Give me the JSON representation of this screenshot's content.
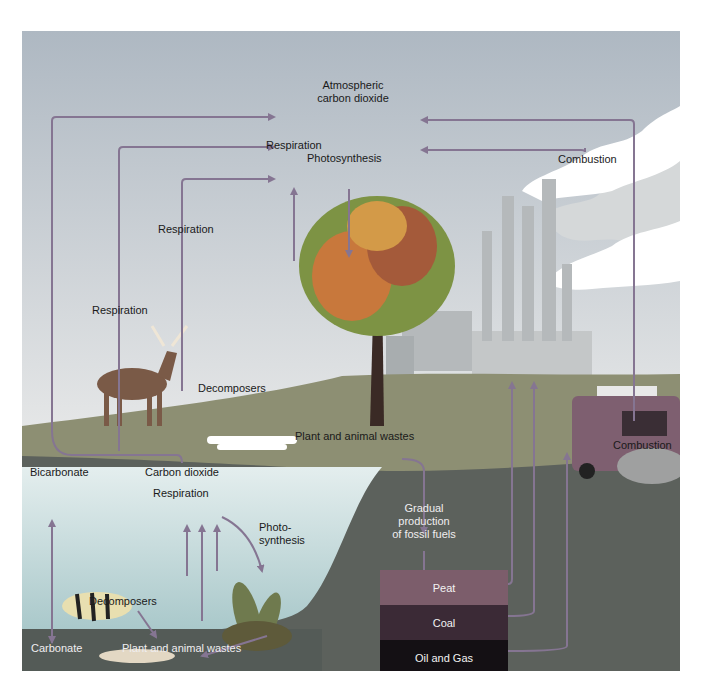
{
  "diagram": {
    "colors": {
      "sky_top": "#aeb8c2",
      "sky_bottom": "#e6e8e9",
      "land": "#8c8e74",
      "lake": "#cfe2e3",
      "lake_floor": "#515a55",
      "underground": "#565b57",
      "arrow": "#857592",
      "peat": "#7c5d6b",
      "coal": "#3b2a36",
      "oil_gas": "#141014"
    },
    "labels": {
      "atmospheric_co2_line1": "Atmospheric",
      "atmospheric_co2_line2": "carbon dioxide",
      "tree_respiration": "Respiration",
      "tree_photosynthesis": "Photosynthesis",
      "combustion_factory": "Combustion",
      "respiration_decomposers": "Respiration",
      "respiration_deer": "Respiration",
      "decomposers_land": "Decomposers",
      "plant_animal_wastes_land": "Plant and animal wastes",
      "combustion_vehicle": "Combustion",
      "bicarbonate": "Bicarbonate",
      "carbon_dioxide_water": "Carbon dioxide",
      "respiration_water": "Respiration",
      "photosynthesis_water_line1": "Photo-",
      "photosynthesis_water_line2": "synthesis",
      "decomposers_water": "Decomposers",
      "carbonate": "Carbonate",
      "plant_animal_wastes_water": "Plant and animal wastes",
      "fossil_line1": "Gradual",
      "fossil_line2": "production",
      "fossil_line3": "of fossil fuels"
    },
    "fossil_fuel_layers": [
      {
        "label": "Peat"
      },
      {
        "label": "Coal"
      },
      {
        "label": "Oil and Gas"
      }
    ],
    "illustrations": [
      "deer",
      "tree",
      "factory-smokestacks",
      "smoke-clouds",
      "camper-vehicle",
      "bones-decomposing",
      "perch-fish",
      "dead-fish",
      "aquatic-plants"
    ]
  }
}
